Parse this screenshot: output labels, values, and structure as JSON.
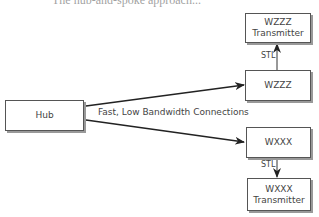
{
  "caption_partial": "The hub-and-spoke approach...",
  "nodes": {
    "hub": {
      "label": "Hub"
    },
    "wzzz": {
      "label": "WZZZ"
    },
    "wzzz_tx": {
      "line1": "WZZZ",
      "line2": "Transmitter"
    },
    "wxxx": {
      "label": "WXXX"
    },
    "wxxx_tx": {
      "line1": "WXXX",
      "line2": "Transmitter"
    }
  },
  "edges": {
    "connection_label": "Fast, Low Bandwidth Connections",
    "stl_top": "STL",
    "stl_bottom": "STL"
  },
  "colors": {
    "line": "#222222",
    "border": "#555555",
    "shadow": "#999999"
  }
}
